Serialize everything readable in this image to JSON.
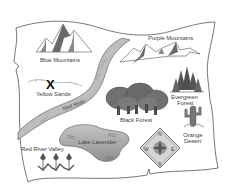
{
  "map": {
    "style": "grayscale illustrated treasure map",
    "colors": {
      "paper": "#ffffff",
      "outline": "#555555",
      "river_fill": "#b8b8b8",
      "mountain_dark": "#6a6a6a",
      "lake_fill": "#a9a9a9",
      "forest_dark": "#5a5a5a"
    },
    "locations": [
      {
        "id": "blue-mountains",
        "label": "Blue Mountains",
        "type": "mountains"
      },
      {
        "id": "purple-mountains",
        "label": "Purple Mountains",
        "type": "mountains"
      },
      {
        "id": "yellow-sands",
        "label": "Yellow Sands",
        "type": "desert",
        "marker": "X"
      },
      {
        "id": "red-river",
        "label": "Red River",
        "type": "river"
      },
      {
        "id": "evergreen-forest",
        "label_line1": "Evergreen",
        "label_line2": "Forest",
        "type": "forest"
      },
      {
        "id": "black-forest",
        "label": "Black Forest",
        "type": "forest"
      },
      {
        "id": "orange-desert",
        "label_line1": "Orange",
        "label_line2": "Desert",
        "type": "desert"
      },
      {
        "id": "lake-lavender",
        "label": "Lake Lavender",
        "type": "lake"
      },
      {
        "id": "red-river-valley",
        "label": "Red River Valley",
        "type": "valley"
      }
    ],
    "compass": {
      "n": "N",
      "s": "S",
      "e": "E",
      "w": "W"
    }
  }
}
